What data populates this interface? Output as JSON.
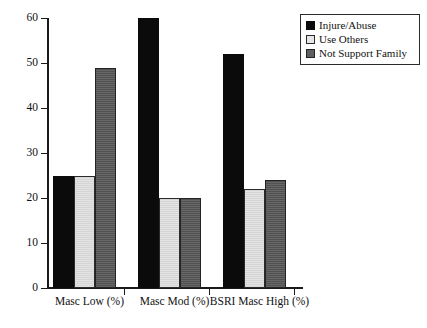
{
  "chart_data": {
    "type": "bar",
    "title": "",
    "subtitle": "",
    "xlabel": "",
    "ylabel": "",
    "categories": [
      "Masc Low (%)",
      "Masc Mod (%)",
      "BSRI Masc High (%)"
    ],
    "series": [
      {
        "name": "Injure/Abuse",
        "values": [
          25,
          60,
          52
        ],
        "color": "#0b0b0b"
      },
      {
        "name": "Use Others",
        "values": [
          25,
          20,
          22
        ],
        "color": "#e3e3e3"
      },
      {
        "name": "Not Support Family",
        "values": [
          49,
          20,
          24
        ],
        "color": "#5f5f5f"
      }
    ],
    "ylim": [
      0,
      60
    ],
    "yticks": [
      0,
      10,
      20,
      30,
      40,
      50,
      60
    ],
    "ytick_labels": [
      "0",
      "10",
      "20",
      "30",
      "40",
      "50",
      "60"
    ],
    "grid": false,
    "legend_position": "top-right",
    "legend_border": true,
    "axis_color": "#1a1a1a",
    "background": "#ffffff"
  }
}
